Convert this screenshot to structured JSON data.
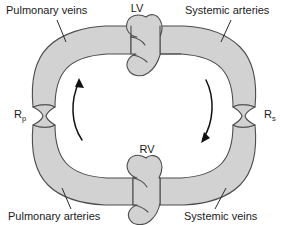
{
  "diagram": {
    "colors": {
      "vessel_fill": "#d2d2d2",
      "vessel_stroke": "#4d4d4d",
      "text": "#1a1a1a",
      "arrow": "#111111",
      "background": "#ffffff"
    },
    "labels": {
      "pulmonary_veins": "Pulmonary veins",
      "systemic_arteries": "Systemic arteries",
      "pulmonary_arteries": "Pulmonary arteries",
      "systemic_veins": "Systemic veins"
    },
    "chambers": {
      "left_ventricle": "LV",
      "right_ventricle": "RV"
    },
    "resistances": {
      "pulmonary": {
        "symbol": "R",
        "subscript": "p"
      },
      "systemic": {
        "symbol": "R",
        "subscript": "s"
      }
    },
    "flow": {
      "left_direction": "upward",
      "right_direction": "downward"
    }
  }
}
